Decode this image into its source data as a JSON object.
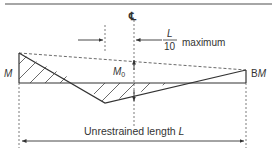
{
  "diagram": {
    "centerline_symbol": "℄",
    "offset_label": {
      "numerator": "L",
      "denominator": "10",
      "suffix": "maximum"
    },
    "left_moment_label": "M",
    "right_moment_label_prefix": "B",
    "right_moment_label_var": "M",
    "mid_moment_label": "M",
    "mid_moment_subscript": "0",
    "length_label_text": "Unrestrained length ",
    "length_label_var": "L",
    "colors": {
      "line": "#333333",
      "rule": "#888888",
      "hatch": "#444444"
    }
  }
}
